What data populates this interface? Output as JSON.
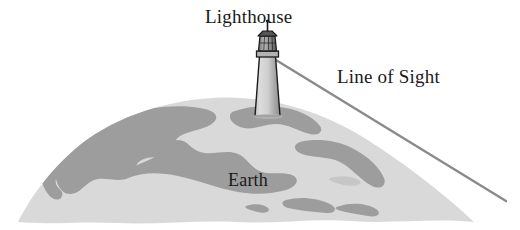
{
  "figure": {
    "background_color": "#ffffff",
    "width": 520,
    "height": 230
  },
  "labels": {
    "lighthouse": "Lighthouse",
    "line_of_sight": "Line of Sight",
    "earth": "Earth"
  },
  "colors": {
    "background": "#ffffff",
    "ocean": "#d9d9d9",
    "land": "#9d9d9d",
    "line_of_sight": "#8a8a8a",
    "lighthouse_outline": "#1c1c1c",
    "lighthouse_body": "#d0d0d0",
    "lighthouse_shadow": "#9a9a9a",
    "text": "#1a1a1a"
  },
  "elements": {
    "earth_shape": "curved dome of the Earth with light gray ocean and darker gray continents",
    "lighthouse_shape": "tapered tower with lantern room, gallery and pointed finial",
    "line_of_sight_shape": "straight gray ray from the lantern to the lower right horizon"
  }
}
